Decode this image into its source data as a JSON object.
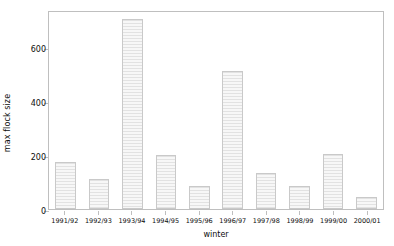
{
  "chart_data": {
    "type": "bar",
    "title": "",
    "xlabel": "winter",
    "ylabel": "max flock size",
    "categories": [
      "1991/92",
      "1992/93",
      "1993/94",
      "1994/95",
      "1995/96",
      "1996/97",
      "1997/98",
      "1998/99",
      "1999/00",
      "2000/01"
    ],
    "values": [
      175,
      110,
      700,
      200,
      85,
      508,
      133,
      85,
      203,
      45
    ],
    "ylim": [
      0,
      735
    ],
    "yticks": [
      0,
      200,
      400,
      600
    ],
    "ytick_labels": [
      "0",
      "200",
      "400",
      "600"
    ],
    "grid": false,
    "legend": null,
    "bar_facecolor": "#f0f0f0",
    "bar_edgecolor": "#c9c9c9",
    "bar_hatch": "horizontal-lines",
    "frame_color": "#bfbfbf",
    "background": "#ffffff",
    "text_color": "#0d0d0d"
  }
}
